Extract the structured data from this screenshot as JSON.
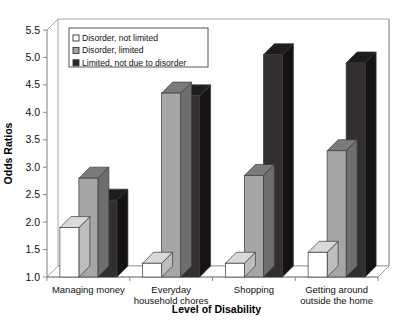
{
  "chart_data": {
    "type": "bar",
    "title": "",
    "subtitle": "",
    "xlabel": "Level of Disability",
    "ylabel": "Odds Ratios",
    "ylim": [
      1.0,
      5.5
    ],
    "ytick_step": 0.5,
    "yticks": [
      "1.0",
      "1.5",
      "2.0",
      "2.5",
      "3.0",
      "3.5",
      "4.0",
      "4.5",
      "5.0",
      "5.5"
    ],
    "grid": false,
    "legend_position": "top-left",
    "style": "3d-clustered-column",
    "categories": [
      "Managing money",
      "Everyday household chores",
      "Shopping",
      "Getting around outside the home"
    ],
    "category_lines": [
      [
        "Managing money"
      ],
      [
        "Everyday",
        "household chores"
      ],
      [
        "Shopping"
      ],
      [
        "Getting around",
        "outside the home"
      ]
    ],
    "series": [
      {
        "name": "Disorder, not limited",
        "color": "#ffffff",
        "top_color": "#d9d9d9",
        "side_color": "#bdbdbd",
        "values": [
          1.9,
          1.25,
          1.25,
          1.45
        ]
      },
      {
        "name": "Disorder, limited",
        "color": "#a6a6a6",
        "top_color": "#7a7a7a",
        "side_color": "#6e6e6e",
        "values": [
          2.8,
          4.35,
          2.85,
          3.3
        ]
      },
      {
        "name": "Limited, not due to disorder",
        "color": "#332f2f",
        "top_color": "#1f1c1c",
        "side_color": "#141212",
        "values": [
          2.4,
          4.3,
          5.05,
          4.9
        ]
      }
    ]
  },
  "legend": {
    "items": [
      {
        "label": "Disorder, not limited",
        "swatch": "#ffffff"
      },
      {
        "label": "Disorder, limited",
        "swatch": "#a6a6a6"
      },
      {
        "label": "Limited, not due to disorder",
        "swatch": "#2b2828"
      }
    ]
  },
  "colors": {
    "axis": "#888888",
    "frame": "#9a9a9a",
    "text": "#111111"
  }
}
